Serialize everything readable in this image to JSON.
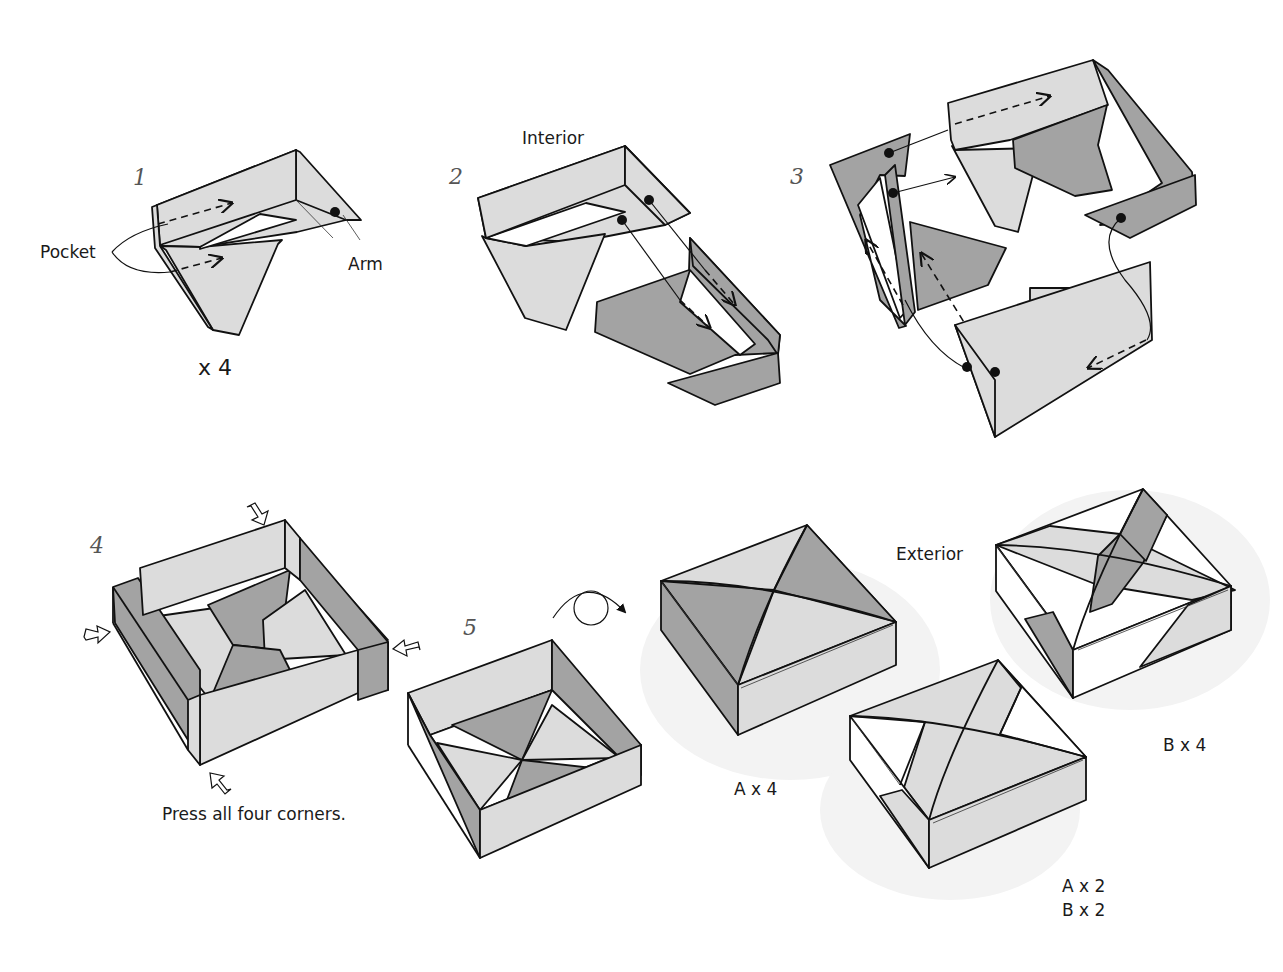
{
  "colors": {
    "light": "#dcdcdc",
    "dark": "#a3a3a3",
    "line": "#111111",
    "shadow": "#f3f3f3"
  },
  "steps": [
    {
      "number": "1",
      "labels": {
        "pocket": "Pocket",
        "arm": "Arm",
        "count": "x 4"
      }
    },
    {
      "number": "2",
      "labels": {
        "interior": "Interior"
      }
    },
    {
      "number": "3"
    },
    {
      "number": "4",
      "labels": {
        "instruction": "Press all four corners."
      }
    },
    {
      "number": "5",
      "labels": {
        "exterior": "Exterior"
      }
    }
  ],
  "variants": [
    {
      "id": "A",
      "label": "A x 4"
    },
    {
      "id": "B",
      "label": "B x 4"
    },
    {
      "id": "AB",
      "label_line1": "A x 2",
      "label_line2": "B x 2"
    }
  ],
  "icons": [
    "turn-over-icon",
    "press-arrow-icon",
    "insert-arrow-icon",
    "attachment-dot-icon"
  ]
}
